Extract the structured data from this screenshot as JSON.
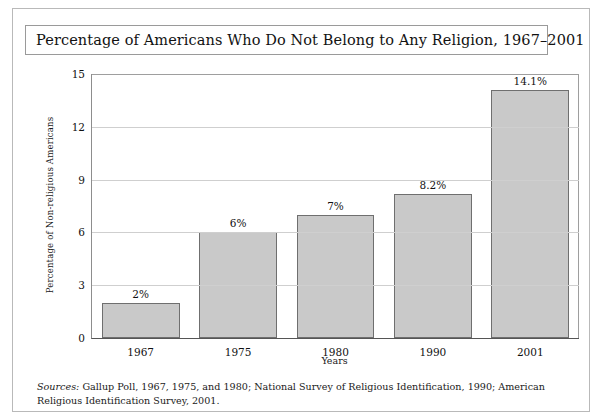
{
  "figure": {
    "title": "Percentage of Americans Who Do Not Belong to Any Religion, 1967–2001",
    "source_label": "Sources:",
    "source_text": " Gallup Poll, 1967, 1975, and 1980; National Survey of Religious Identification, 1990; American Religious Identification Survey, 2001."
  },
  "colors": {
    "bar_fill": "#c9c9c9",
    "bar_border": "#6f6f6f",
    "gridline": "#cfcfcf",
    "frame": "#b9b9b9",
    "text": "#111111"
  },
  "chart_data": {
    "type": "bar",
    "title": "Percentage of Americans Who Do Not Belong to Any Religion, 1967–2001",
    "xlabel": "Years",
    "ylabel": "Percentage of Non-religious Americans",
    "categories": [
      "1967",
      "1975",
      "1980",
      "1990",
      "2001"
    ],
    "values": [
      2,
      6,
      7,
      8.2,
      14.1
    ],
    "data_labels": [
      "2%",
      "6%",
      "7%",
      "8.2%",
      "14.1%"
    ],
    "ylim": [
      0,
      15
    ],
    "yticks": [
      0,
      3,
      6,
      9,
      12,
      15
    ],
    "ytick_labels": [
      "0",
      "3",
      "6",
      "9",
      "12",
      "15"
    ],
    "grid": true,
    "legend": "none"
  }
}
